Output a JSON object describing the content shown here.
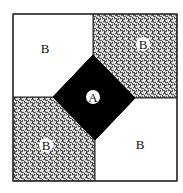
{
  "diagram": {
    "regions": [
      {
        "id": "top-left",
        "label": "B",
        "fill": "white"
      },
      {
        "id": "top-right",
        "label": "B",
        "fill": "patterned"
      },
      {
        "id": "center-diamond",
        "label": "A",
        "fill": "black"
      },
      {
        "id": "bottom-left",
        "label": "B",
        "fill": "patterned"
      },
      {
        "id": "bottom-right",
        "label": "B",
        "fill": "white"
      }
    ],
    "labels": {
      "a": "A",
      "b1": "B",
      "b2": "B",
      "b3": "B",
      "b4": "B"
    },
    "colors": {
      "border": "#222222",
      "diamond": "#000000",
      "pattern_dark": "#333333",
      "pattern_light": "#e6e6e6"
    }
  }
}
